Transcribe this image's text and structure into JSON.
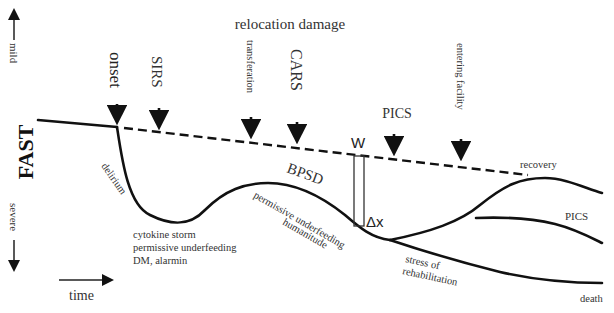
{
  "axes": {
    "y_label": "FAST",
    "y_top_label": "mild",
    "y_bottom_label": "severe",
    "x_label": "time"
  },
  "header": {
    "title": "relocation damage"
  },
  "events": [
    {
      "label": "onset"
    },
    {
      "label": "SIRS"
    },
    {
      "label": "transferation"
    },
    {
      "label": "CARS"
    },
    {
      "label": "PICS"
    },
    {
      "label": "entering facility"
    }
  ],
  "annotations": {
    "delirium": "delirium",
    "cytokine_lines": [
      "cytokine storm",
      "permissive underfeeding",
      "DM, alarmin"
    ],
    "bpsd": "BPSD",
    "permissive_lines": [
      "permissive underfeeding",
      "humanitude"
    ],
    "w": "W",
    "delta_x": "Δx",
    "recovery": "recovery",
    "pics_outcome": "PICS",
    "stress_lines": [
      "stress of",
      "rehabilitation"
    ],
    "death": "death"
  }
}
